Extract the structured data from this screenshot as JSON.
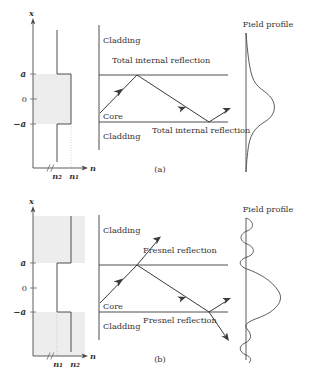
{
  "figure": {
    "panels": [
      {
        "id": "a",
        "caption": "(a)",
        "index_profile": {
          "axis_vertical_label": "x",
          "axis_horizontal_label": "n",
          "tick_labels": [
            "a",
            "0",
            "−a"
          ],
          "index_labels": [
            "n₂",
            "n₁"
          ],
          "core_index_label": "n₁",
          "cladding_index_label": "n₂",
          "shaded_region": "core",
          "description": "Step index profile, core index higher than cladding index"
        },
        "ray_diagram": {
          "region_labels": [
            "Cladding",
            "Core",
            "Cladding"
          ],
          "annotations": [
            "Total internal reflection",
            "Total internal reflection"
          ],
          "ray_behavior": "fully reflected, zigzag confined in core"
        },
        "field_profile": {
          "title": "Field profile",
          "shape": "single lobe, evanescent decaying tails",
          "confined": "true"
        }
      },
      {
        "id": "b",
        "caption": "(b)",
        "index_profile": {
          "axis_vertical_label": "x",
          "axis_horizontal_label": "n",
          "tick_labels": [
            "a",
            "0",
            "−a"
          ],
          "index_labels": [
            "n₁",
            "n₂"
          ],
          "core_index_label": "n₁",
          "cladding_index_label": "n₂",
          "shaded_region": "cladding",
          "description": "Step index profile, cladding index higher than core index"
        },
        "ray_diagram": {
          "region_labels": [
            "Cladding",
            "Core",
            "Cladding"
          ],
          "annotations": [
            "Fresnel reflection",
            "Fresnel reflection"
          ],
          "ray_behavior": "partially reflected, partially refracted out of core"
        },
        "field_profile": {
          "title": "Field profile",
          "shape": "large lobe in core with oscillating radiating tails",
          "confined": "false"
        }
      }
    ],
    "colors": {
      "shade": "#ededed",
      "line": "#3a3a3a",
      "text": "#333333",
      "background": "#ffffff"
    }
  }
}
